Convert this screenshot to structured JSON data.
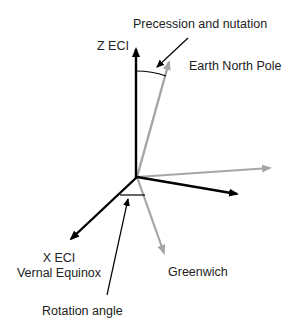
{
  "labels": {
    "z_eci": "Z ECI",
    "precession": "Precession and nutation",
    "earth_north_pole": "Earth North Pole",
    "x_eci": "X ECI",
    "vernal_equinox": "Vernal Equinox",
    "greenwich": "Greenwich",
    "rotation_angle": "Rotation angle"
  },
  "colors": {
    "eci_axes": "#000000",
    "earth_axes": "#a6a6a6",
    "text": "#222222"
  }
}
